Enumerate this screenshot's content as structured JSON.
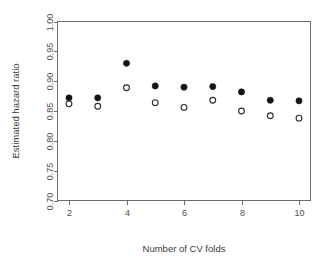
{
  "chart_data": {
    "type": "scatter",
    "title": "",
    "xlabel": "Number of CV folds",
    "ylabel": "Estimated hazard ratio",
    "xlim": [
      1.6,
      10.4
    ],
    "ylim": [
      0.7,
      1.0
    ],
    "xticks": [
      2,
      4,
      6,
      8,
      10
    ],
    "xtick_labels": [
      "2",
      "4",
      "6",
      "8",
      "10"
    ],
    "yticks": [
      0.7,
      0.75,
      0.8,
      0.85,
      0.9,
      0.95,
      1.0
    ],
    "ytick_labels": [
      "0.70",
      "0.75",
      "0.80",
      "0.85",
      "0.90",
      "0.95",
      "1.00"
    ],
    "grid": false,
    "legend": "none",
    "x": [
      2,
      3,
      4,
      5,
      6,
      7,
      8,
      9,
      10
    ],
    "series": [
      {
        "name": "filled",
        "marker": "filled-circle",
        "color": "#141414",
        "values": [
          0.872,
          0.872,
          0.93,
          0.892,
          0.89,
          0.891,
          0.882,
          0.868,
          0.867
        ]
      },
      {
        "name": "open",
        "marker": "open-circle",
        "color": "#2b2b2b",
        "values": [
          0.862,
          0.858,
          0.889,
          0.864,
          0.856,
          0.868,
          0.85,
          0.842,
          0.838
        ]
      }
    ]
  },
  "axes": {
    "x_axis_title": "Number of CV folds",
    "y_axis_title": "Estimated hazard ratio"
  }
}
